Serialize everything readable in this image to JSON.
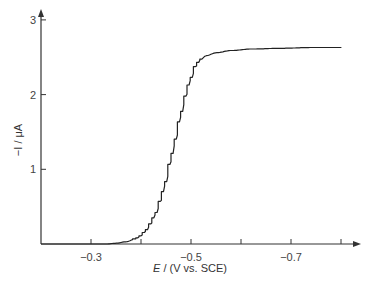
{
  "chart_data": {
    "type": "line",
    "title": "",
    "xlabel": "E / (V vs. SCE)",
    "xlabel_italic_part": "E",
    "xlabel_rest": " / (V vs. SCE)",
    "ylabel": "−I / μA",
    "xlim": [
      -0.2,
      -0.8
    ],
    "ylim": [
      0,
      3
    ],
    "x_ticks": [
      -0.3,
      -0.4,
      -0.5,
      -0.6,
      -0.7,
      -0.8
    ],
    "x_tick_labels": [
      "−0.3",
      "",
      "−0.5",
      "",
      "−0.7",
      ""
    ],
    "y_ticks": [
      1,
      2,
      3
    ],
    "y_tick_labels": [
      "1",
      "2",
      "3"
    ],
    "grid": false,
    "legend": null,
    "series": [
      {
        "name": "staircase voltammogram",
        "style": "staircase",
        "x": [
          -0.33,
          -0.35,
          -0.37,
          -0.39,
          -0.4,
          -0.41,
          -0.42,
          -0.43,
          -0.44,
          -0.45,
          -0.46,
          -0.47,
          -0.48,
          -0.49,
          -0.5,
          -0.51,
          -0.52,
          -0.53,
          -0.55,
          -0.58,
          -0.62,
          -0.68,
          -0.74,
          -0.8
        ],
        "values": [
          0.0,
          0.01,
          0.03,
          0.07,
          0.11,
          0.17,
          0.27,
          0.4,
          0.58,
          0.82,
          1.1,
          1.4,
          1.7,
          1.98,
          2.2,
          2.38,
          2.47,
          2.52,
          2.56,
          2.59,
          2.61,
          2.62,
          2.63,
          2.63
        ]
      }
    ]
  },
  "axes": {
    "x_label_italic": "E",
    "x_label_rest": " / (V vs. SCE)",
    "y_label": "−I / μA"
  }
}
